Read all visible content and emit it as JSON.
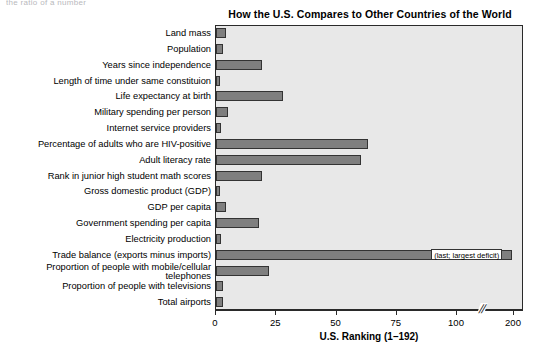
{
  "top_sliver_text": "the ratio of a number",
  "chart_data": {
    "type": "bar",
    "orientation": "horizontal",
    "title": "How the U.S. Compares to Other Countries of the World",
    "xlabel": "U.S. Ranking (1–192)",
    "ylabel": "",
    "xlim": [
      0,
      200
    ],
    "grid": false,
    "legend": null,
    "axis_break": {
      "label": "//",
      "between": [
        100,
        200
      ]
    },
    "xticks": [
      0,
      25,
      50,
      75,
      100,
      200
    ],
    "xtick_labels": [
      "0",
      "25",
      "50",
      "75",
      "100",
      "200"
    ],
    "categories": [
      "Land mass",
      "Population",
      "Years since independence",
      "Length of time under same constituion",
      "Life expectancy at birth",
      "Military spending per person",
      "Internet service providers",
      "Percentage of adults who are HIV-positive",
      "Adult literacy rate",
      "Rank in junior high student math scores",
      "Gross domestic product (GDP)",
      "GDP per capita",
      "Government spending per capita",
      "Electricity production",
      "Trade balance (exports minus imports)",
      "Proportion of people with mobile/cellular telephones",
      "Proportion of people with televisions",
      "Total airports"
    ],
    "values": [
      4,
      3,
      19,
      1,
      28,
      5,
      2,
      63,
      60,
      19,
      1,
      4,
      18,
      2,
      192,
      22,
      3,
      3
    ],
    "annotations": [
      {
        "category": "Trade balance (exports minus imports)",
        "text": "(last; largest deficit)"
      }
    ],
    "bar_color": "#7f7f7f",
    "bar_edge_color": "#333333",
    "plot_background": "#e8e8e8"
  }
}
